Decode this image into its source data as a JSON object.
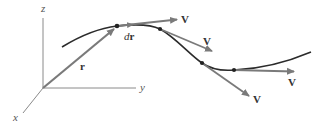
{
  "figure": {
    "colors": {
      "curve": "#2b2b2b",
      "vector": "#7a7a7a",
      "axis": "#8a8a8a",
      "point": "#222222"
    },
    "axes": {
      "z_label": "z",
      "y_label": "y",
      "x_label": "x"
    },
    "vectors": {
      "position_label": "r",
      "differential_d": "d",
      "differential_r": "r",
      "velocity_labels": [
        "V",
        "V",
        "V",
        "V"
      ]
    }
  }
}
